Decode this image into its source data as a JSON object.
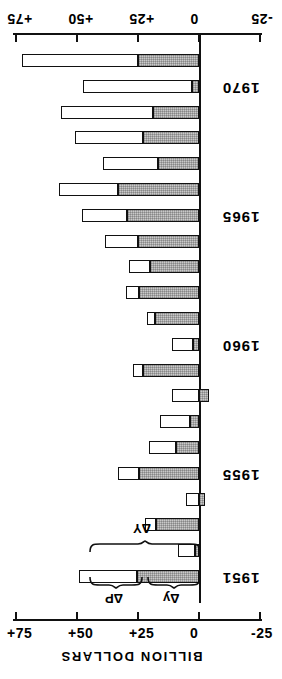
{
  "figure": {
    "orientation": "rotated-90",
    "axis_title": "BILLION DOLLARS",
    "note": "horizontal bar chart rotated; positive values extend left of zero"
  },
  "axis": {
    "ticks": [
      "+75",
      "+50",
      "+25",
      "0",
      "-25"
    ],
    "tick_values": [
      75,
      50,
      25,
      0,
      -25
    ],
    "min": -25,
    "max": 80
  },
  "annotations": {
    "total": "ΔY",
    "price": "ΔP",
    "real": "Δy"
  },
  "year_labels": [
    "1951",
    "1955",
    "1960",
    "1965",
    "1970"
  ],
  "colors": {
    "ink": "#111111",
    "price_fill": "#ffffff",
    "real_fill": "#c9c9c9",
    "background": "#ffffff"
  },
  "chart_data": {
    "type": "bar",
    "title": "",
    "subtitle": "",
    "xlabel": "BILLION DOLLARS",
    "ylabel": "",
    "orientation": "horizontal",
    "stacked": true,
    "grid": false,
    "legend": "none",
    "xlim": [
      -25,
      80
    ],
    "xticks": [
      75,
      50,
      25,
      0,
      -25
    ],
    "xticklabels": [
      "+75",
      "+50",
      "+25",
      "0",
      "-25"
    ],
    "categories": [
      "1951",
      "1952",
      "1953",
      "1954",
      "1955",
      "1956",
      "1957",
      "1958",
      "1959",
      "1960",
      "1961",
      "1962",
      "1963",
      "1964",
      "1965",
      "1966",
      "1967",
      "1968",
      "1969",
      "1970",
      "1971"
    ],
    "series": [
      {
        "name": "Δy",
        "description": "real output change (shaded)",
        "values": [
          25.5,
          1.5,
          17.5,
          -2.5,
          24.5,
          9.5,
          3.5,
          -4.0,
          23.0,
          2.5,
          18.0,
          24.5,
          20.0,
          25.0,
          29.5,
          33.0,
          17.0,
          23.0,
          19.0,
          3.0,
          25.0
        ]
      },
      {
        "name": "ΔP",
        "description": "price change (open / white)",
        "values": [
          23.5,
          7.0,
          4.5,
          5.5,
          8.5,
          11.0,
          12.5,
          11.0,
          4.0,
          8.5,
          3.5,
          5.5,
          8.5,
          13.5,
          18.5,
          24.5,
          22.5,
          28.0,
          37.5,
          44.5,
          47.5
        ]
      }
    ],
    "totals": {
      "name": "ΔY",
      "values": [
        49.0,
        8.5,
        22.0,
        3.0,
        33.0,
        20.5,
        16.0,
        7.0,
        27.0,
        11.0,
        21.5,
        30.0,
        28.5,
        38.5,
        48.0,
        57.5,
        39.5,
        51.0,
        56.5,
        47.5,
        72.5
      ]
    }
  }
}
